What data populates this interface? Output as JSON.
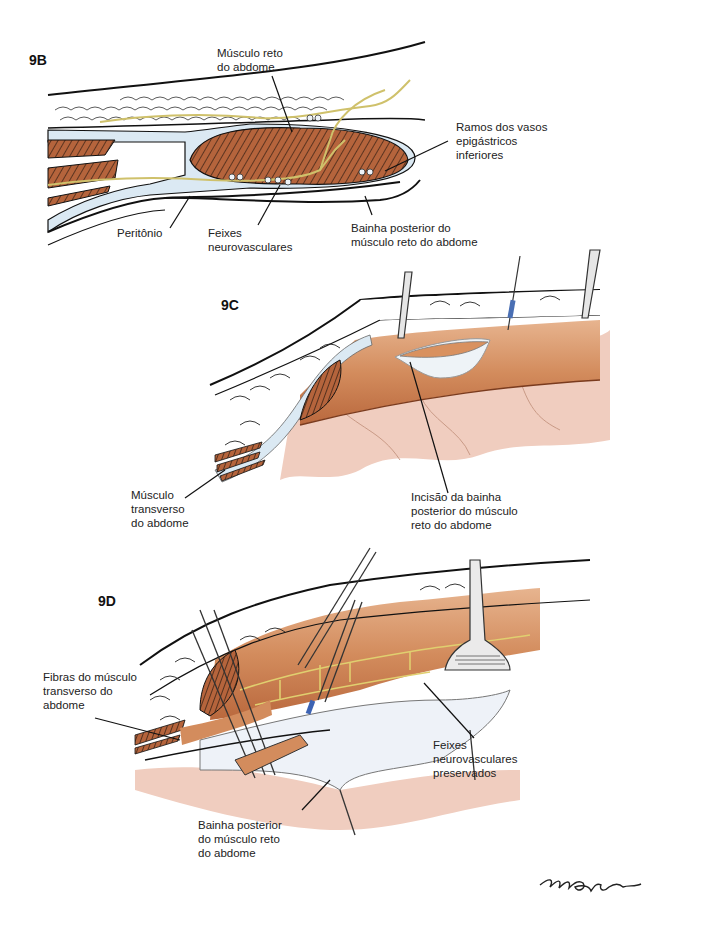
{
  "figure": {
    "panels": [
      {
        "id": "9B",
        "label": "9B",
        "annotations": [
          {
            "text": "Músculo reto\ndo abdome"
          },
          {
            "text": "Ramos dos vasos\nepigástricos\ninferiores"
          },
          {
            "text": "Peritônio"
          },
          {
            "text": "Feixes\nneurovasculares"
          },
          {
            "text": "Bainha posterior do\nmúsculo reto do abdome"
          }
        ]
      },
      {
        "id": "9C",
        "label": "9C",
        "annotations": [
          {
            "text": "Músculo\ntransverso\ndo abdome"
          },
          {
            "text": "Incisão da bainha\nposterior do músculo\nreto do abdome"
          }
        ]
      },
      {
        "id": "9D",
        "label": "9D",
        "annotations": [
          {
            "text": "Fibras do músculo\ntransverso do\nabdome"
          },
          {
            "text": "Feixes\nneurovasculares\npreservados"
          },
          {
            "text": "Bainha posterior\ndo músculo reto\ndo abdome"
          }
        ]
      }
    ],
    "signature": "MBitam",
    "colors": {
      "muscle": "#b5643c",
      "muscle_light": "#d9915f",
      "fascia": "#dbe9f3",
      "fat": "#ffffff",
      "nerve": "#d8cf7a",
      "peritoneum_bg": "#f1cdbc",
      "outline": "#111111"
    }
  }
}
